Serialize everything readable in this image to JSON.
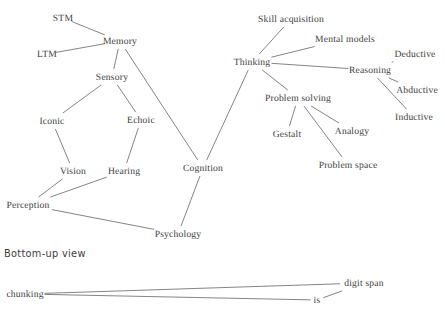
{
  "canvas": {
    "width": 445,
    "height": 323,
    "background": "#ffffff"
  },
  "style": {
    "edge_color": "#6e6e6e",
    "text_color": "#3d3d3d",
    "node_font_px": 9.6,
    "section_font_px": 9.8
  },
  "sections": [
    {
      "id": "bottom-up-view",
      "label": "Bottom-up view",
      "x": 4,
      "y": 253
    }
  ],
  "diagrams": [
    {
      "id": "top-down-map",
      "title": "Cognitive psychology concept map",
      "nodes": [
        {
          "id": "stm",
          "label": "STM",
          "x": 63,
          "y": 18
        },
        {
          "id": "ltm",
          "label": "LTM",
          "x": 47,
          "y": 54
        },
        {
          "id": "memory",
          "label": "Memory",
          "x": 120,
          "y": 41
        },
        {
          "id": "sensory",
          "label": "Sensory",
          "x": 112,
          "y": 77
        },
        {
          "id": "iconic",
          "label": "Iconic",
          "x": 52,
          "y": 121
        },
        {
          "id": "echoic",
          "label": "Echoic",
          "x": 141,
          "y": 120
        },
        {
          "id": "vision",
          "label": "Vision",
          "x": 73,
          "y": 171
        },
        {
          "id": "hearing",
          "label": "Hearing",
          "x": 124,
          "y": 171
        },
        {
          "id": "perception",
          "label": "Perception",
          "x": 28,
          "y": 205
        },
        {
          "id": "psychology",
          "label": "Psychology",
          "x": 178,
          "y": 234
        },
        {
          "id": "cognition",
          "label": "Cognition",
          "x": 203,
          "y": 168
        },
        {
          "id": "thinking",
          "label": "Thinking",
          "x": 252,
          "y": 62
        },
        {
          "id": "skill-acquisition",
          "label": "Skill acquisition",
          "x": 291,
          "y": 19
        },
        {
          "id": "mental-models",
          "label": "Mental models",
          "x": 345,
          "y": 39
        },
        {
          "id": "reasoning",
          "label": "Reasoning",
          "x": 370,
          "y": 70
        },
        {
          "id": "deductive",
          "label": "Deductive",
          "x": 415,
          "y": 54
        },
        {
          "id": "abductive",
          "label": "Abductive",
          "x": 417,
          "y": 90
        },
        {
          "id": "inductive",
          "label": "Inductive",
          "x": 414,
          "y": 117
        },
        {
          "id": "problem-solving",
          "label": "Problem solving",
          "x": 298,
          "y": 98
        },
        {
          "id": "gestalt",
          "label": "Gestalt",
          "x": 287,
          "y": 134
        },
        {
          "id": "analogy",
          "label": "Analogy",
          "x": 352,
          "y": 131
        },
        {
          "id": "problem-space",
          "label": "Problem space",
          "x": 348,
          "y": 165
        }
      ],
      "edges": [
        {
          "from": "stm",
          "to": "memory"
        },
        {
          "from": "ltm",
          "to": "memory"
        },
        {
          "from": "memory",
          "to": "sensory"
        },
        {
          "from": "memory",
          "to": "cognition"
        },
        {
          "from": "sensory",
          "to": "iconic"
        },
        {
          "from": "sensory",
          "to": "echoic"
        },
        {
          "from": "iconic",
          "to": "vision"
        },
        {
          "from": "echoic",
          "to": "hearing"
        },
        {
          "from": "vision",
          "to": "perception"
        },
        {
          "from": "hearing",
          "to": "perception"
        },
        {
          "from": "perception",
          "to": "psychology"
        },
        {
          "from": "psychology",
          "to": "cognition"
        },
        {
          "from": "cognition",
          "to": "thinking"
        },
        {
          "from": "thinking",
          "to": "skill-acquisition"
        },
        {
          "from": "thinking",
          "to": "mental-models"
        },
        {
          "from": "thinking",
          "to": "reasoning"
        },
        {
          "from": "thinking",
          "to": "problem-solving"
        },
        {
          "from": "reasoning",
          "to": "deductive"
        },
        {
          "from": "reasoning",
          "to": "abductive"
        },
        {
          "from": "reasoning",
          "to": "inductive"
        },
        {
          "from": "problem-solving",
          "to": "gestalt"
        },
        {
          "from": "problem-solving",
          "to": "analogy"
        },
        {
          "from": "problem-solving",
          "to": "problem-space"
        }
      ]
    },
    {
      "id": "bottom-up-map",
      "title": "Bottom-up view concept map (partially visible)",
      "nodes": [
        {
          "id": "chunking",
          "label": "chunking",
          "x": 25,
          "y": 294
        },
        {
          "id": "digit-span",
          "label": "digit span",
          "x": 364,
          "y": 283
        },
        {
          "id": "is",
          "label": "is",
          "x": 317,
          "y": 300
        }
      ],
      "edges": [
        {
          "from": "chunking",
          "to": "is"
        },
        {
          "from": "is",
          "to": "digit-span"
        },
        {
          "from": "digit-span",
          "to": "chunking"
        }
      ]
    }
  ]
}
